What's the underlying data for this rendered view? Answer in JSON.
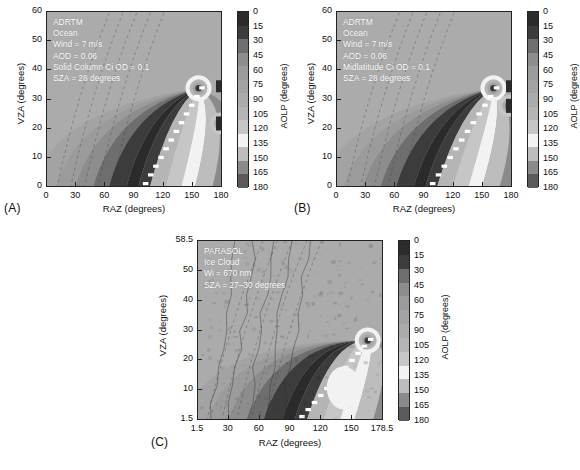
{
  "figure": {
    "panels": [
      {
        "id": "A",
        "label": "(A)",
        "annotations": [
          "ADRTM",
          "Ocean",
          "Wind = 7 m/s",
          "AOD = 0.06",
          "Solid Column Ci OD = 0.1",
          "SZA = 28 degrees"
        ],
        "xlabel": "RAZ (degrees)",
        "ylabel": "VZA (degrees)",
        "xticks": [
          "0",
          "30",
          "60",
          "90",
          "120",
          "150",
          "180"
        ],
        "yticks": [
          "0",
          "10",
          "20",
          "30",
          "40",
          "50",
          "60"
        ],
        "xlim": [
          0,
          180
        ],
        "ylim": [
          0,
          60
        ],
        "cbar_title": "AOLP (degrees)"
      },
      {
        "id": "B",
        "label": "(B)",
        "annotations": [
          "ADRTM",
          "Ocean",
          "Wind = 7 m/s",
          "AOD = 0.06",
          "Midlatitude Ci OD = 0.1",
          "SZA = 28 degrees"
        ],
        "xlabel": "RAZ (degrees)",
        "ylabel": "VZA (degrees)",
        "xticks": [
          "0",
          "30",
          "60",
          "90",
          "120",
          "150",
          "180"
        ],
        "yticks": [
          "0",
          "10",
          "20",
          "30",
          "40",
          "50",
          "60"
        ],
        "xlim": [
          0,
          180
        ],
        "ylim": [
          0,
          60
        ],
        "cbar_title": "AOLP (degrees)"
      },
      {
        "id": "C",
        "label": "(C)",
        "annotations": [
          "PARASOL",
          "Ice Cloud",
          "Wi = 670 nm",
          "SZA = 27–30 degrees"
        ],
        "xlabel": "RAZ (degrees)",
        "ylabel": "VZA (degrees)",
        "xticks": [
          "1.5",
          "30",
          "60",
          "90",
          "120",
          "150",
          "178.5"
        ],
        "yticks": [
          "1.5",
          "10",
          "20",
          "30",
          "40",
          "50",
          "58.5"
        ],
        "xlim": [
          1.5,
          178.5
        ],
        "ylim": [
          1.5,
          58.5
        ],
        "cbar_title": "AOLP (degrees)"
      }
    ],
    "colorbar": {
      "title": "AOLP (degrees)",
      "ticks": [
        "0",
        "15",
        "30",
        "45",
        "60",
        "75",
        "90",
        "105",
        "120",
        "135",
        "150",
        "165",
        "180"
      ],
      "vmin": 0,
      "vmax": 180,
      "step": 15,
      "band_colors": [
        "#2b2b2b",
        "#3c3c3c",
        "#6e6e6e",
        "#8d8d8d",
        "#9b9b9b",
        "#a3a3a3",
        "#ababab",
        "#b5b5b5",
        "#c6c6c6",
        "#f2f2f2",
        "#bdbdbd",
        "#8a8a8a",
        "#5a5a5a"
      ]
    }
  },
  "chart_data": {
    "type": "heatmap",
    "title": "",
    "subtitle": "",
    "xlabel": "RAZ (degrees)",
    "ylabel": "VZA (degrees)",
    "zlabel": "AOLP (degrees)",
    "zlim": [
      0,
      180
    ],
    "zstep": 15,
    "grid": false,
    "legend_position": "right-colorbar",
    "panels": [
      {
        "id": "A",
        "name": "ADRTM Solid Column Ci",
        "xlim": [
          0,
          180
        ],
        "ylim": [
          0,
          60
        ],
        "xticks": [
          0,
          30,
          60,
          90,
          120,
          150,
          180
        ],
        "yticks": [
          0,
          10,
          20,
          30,
          40,
          50,
          60
        ],
        "contour_levels": [
          0,
          15,
          30,
          45,
          60,
          75,
          90,
          105,
          120,
          135,
          150,
          165,
          180
        ],
        "features": {
          "neutral_background_aolp": 90,
          "dark_band_aolp_range": [
            0,
            30
          ],
          "dark_band_path_raz_at_vza0": 95,
          "dark_band_path_raz_at_vza35": 150,
          "bright_band_aolp_range": [
            120,
            150
          ],
          "bright_band_raz_at_vza0": 150,
          "singular_point_raz": 155,
          "singular_point_vza": 34,
          "secondary_singular_raz": 178,
          "secondary_singular_vza": 22
        },
        "annotations": [
          "ADRTM",
          "Ocean",
          "Wind = 7 m/s",
          "AOD = 0.06",
          "Solid Column Ci OD = 0.1",
          "SZA = 28 degrees"
        ]
      },
      {
        "id": "B",
        "name": "ADRTM Midlatitude Ci",
        "xlim": [
          0,
          180
        ],
        "ylim": [
          0,
          60
        ],
        "xticks": [
          0,
          30,
          60,
          90,
          120,
          150,
          180
        ],
        "yticks": [
          0,
          10,
          20,
          30,
          40,
          50,
          60
        ],
        "contour_levels": [
          0,
          15,
          30,
          45,
          60,
          75,
          90,
          105,
          120,
          135,
          150,
          165,
          180
        ],
        "features": {
          "neutral_background_aolp": 90,
          "dark_band_aolp_range": [
            0,
            30
          ],
          "dark_band_path_raz_at_vza0": 92,
          "dark_band_path_raz_at_vza35": 158,
          "bright_band_aolp_range": [
            120,
            150
          ],
          "bright_band_raz_at_vza0": 148,
          "singular_point_raz": 160,
          "singular_point_vza": 34,
          "secondary_singular_raz": 176,
          "secondary_singular_vza": 28
        },
        "annotations": [
          "ADRTM",
          "Ocean",
          "Wind = 7 m/s",
          "AOD = 0.06",
          "Midlatitude Ci OD = 0.1",
          "SZA = 28 degrees"
        ]
      },
      {
        "id": "C",
        "name": "PARASOL Ice Cloud",
        "xlim": [
          1.5,
          178.5
        ],
        "ylim": [
          1.5,
          58.5
        ],
        "xticks": [
          1.5,
          30,
          60,
          90,
          120,
          150,
          178.5
        ],
        "yticks": [
          1.5,
          10,
          20,
          30,
          40,
          50,
          58.5
        ],
        "contour_levels": [
          0,
          15,
          30,
          45,
          60,
          75,
          90,
          105,
          120,
          135,
          150,
          165,
          180
        ],
        "features": {
          "neutral_background_aolp": 90,
          "dark_band_aolp_range": [
            0,
            30
          ],
          "dark_band_path_raz_at_vza1_5": 95,
          "dark_band_path_raz_at_vza35": 160,
          "bright_band_aolp_range": [
            120,
            150
          ],
          "bright_band_raz_at_vza1_5": 150,
          "singular_point_raz": 163,
          "singular_point_vza": 27,
          "noisy": true
        },
        "annotations": [
          "PARASOL",
          "Ice Cloud",
          "Wi = 670 nm",
          "SZA = 27–30 degrees"
        ]
      }
    ]
  }
}
